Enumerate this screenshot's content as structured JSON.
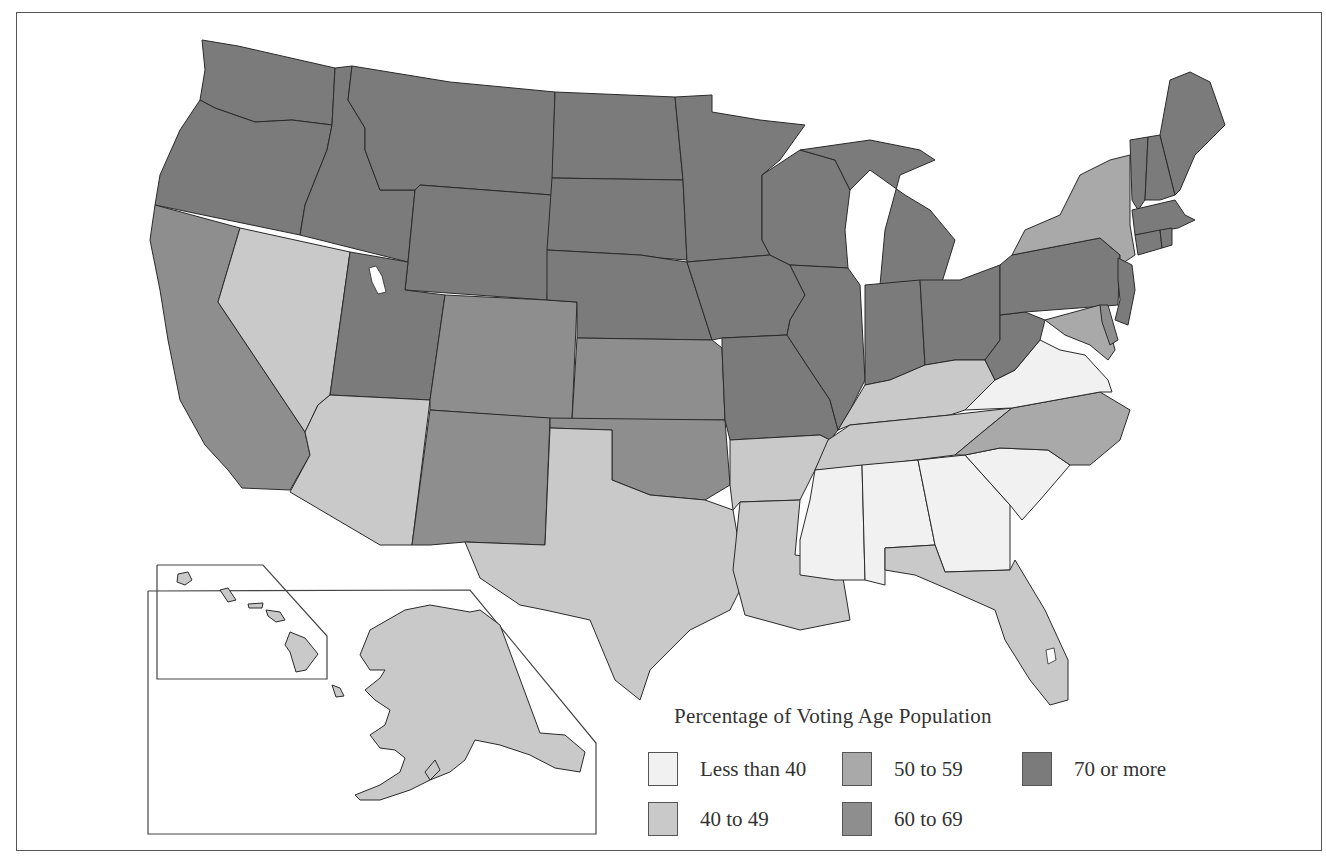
{
  "map": {
    "title": "Percentage of Voting Age Population",
    "categories": [
      {
        "id": "lt40",
        "label": "Less than 40",
        "color": "#f1f1f1"
      },
      {
        "id": "40_49",
        "label": "40 to 49",
        "color": "#c9c9c9"
      },
      {
        "id": "50_59",
        "label": "50 to 59",
        "color": "#a9a9a9"
      },
      {
        "id": "60_69",
        "label": "60 to 69",
        "color": "#8e8e8e"
      },
      {
        "id": "70plus",
        "label": "70 or more",
        "color": "#7b7b7b"
      }
    ],
    "states": {
      "WA": "70plus",
      "OR": "70plus",
      "ID": "70plus",
      "MT": "70plus",
      "WY": "70plus",
      "ND": "70plus",
      "SD": "70plus",
      "MN": "70plus",
      "NE": "70plus",
      "IA": "70plus",
      "WI": "70plus",
      "MI": "70plus",
      "UT": "70plus",
      "MO": "70plus",
      "IL": "70plus",
      "IN": "70plus",
      "OH": "70plus",
      "PA": "70plus",
      "WV": "70plus",
      "OK": "60_69",
      "ME": "70plus",
      "NH": "70plus",
      "VT": "70plus",
      "MA": "70plus",
      "CT": "70plus",
      "RI": "70plus",
      "NJ": "70plus",
      "DE": "60_69",
      "CA": "60_69",
      "CO": "60_69",
      "KS": "60_69",
      "NM": "60_69",
      "NY": "50_59",
      "MD": "50_59",
      "NC": "50_59",
      "NV": "40_49",
      "AZ": "40_49",
      "TX": "40_49",
      "AR": "40_49",
      "LA": "40_49",
      "TN": "40_49",
      "KY": "40_49",
      "FL": "40_49",
      "AK": "40_49",
      "HI": "40_49",
      "VA": "lt40",
      "SC": "lt40",
      "GA": "lt40",
      "AL": "lt40",
      "MS": "lt40"
    }
  },
  "legend": {
    "title": "Percentage of Voting Age Population",
    "items": [
      {
        "label": "Less than 40",
        "color": "#f1f1f1"
      },
      {
        "label": "40 to 49",
        "color": "#c9c9c9"
      },
      {
        "label": "50 to 59",
        "color": "#a9a9a9"
      },
      {
        "label": "60 to 69",
        "color": "#8e8e8e"
      },
      {
        "label": "70 or more",
        "color": "#7b7b7b"
      }
    ]
  }
}
